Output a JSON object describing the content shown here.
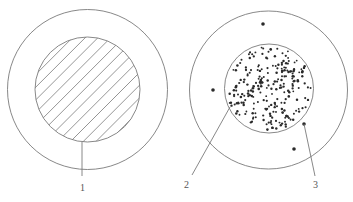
{
  "figure": {
    "line_color": "#7a7a7a",
    "dot_color": "#2a2a2a",
    "left": {
      "outer_circle": {
        "cx": 87.5,
        "cy": 89.5,
        "r": 80
      },
      "inner_circle": {
        "cx": 87.5,
        "cy": 89.5,
        "r": 52.5
      },
      "hatch": {
        "angle_deg": 45,
        "spacing": 9
      },
      "leader": {
        "x1": 82,
        "y1": 142,
        "x2": 82,
        "y2": 176
      },
      "label": {
        "text": "1",
        "x": 80,
        "y": 191
      }
    },
    "right": {
      "outer_circle": {
        "cx": 268.5,
        "cy": 90,
        "r": 79
      },
      "inner_circle": {
        "cx": 269,
        "cy": 88.5,
        "r": 44.5
      },
      "outer_dots": [
        {
          "x": 263,
          "y": 24
        },
        {
          "x": 213,
          "y": 90
        },
        {
          "x": 304,
          "y": 124
        },
        {
          "x": 294,
          "y": 149
        }
      ],
      "inner_dot_count": 240,
      "leaders": [
        {
          "x1": 230,
          "y1": 107,
          "x2": 192,
          "y2": 175
        },
        {
          "x1": 304,
          "y1": 124,
          "x2": 315,
          "y2": 176
        }
      ],
      "labels": [
        {
          "text": "2",
          "x": 184,
          "y": 188
        },
        {
          "text": "3",
          "x": 313,
          "y": 188
        }
      ]
    }
  }
}
